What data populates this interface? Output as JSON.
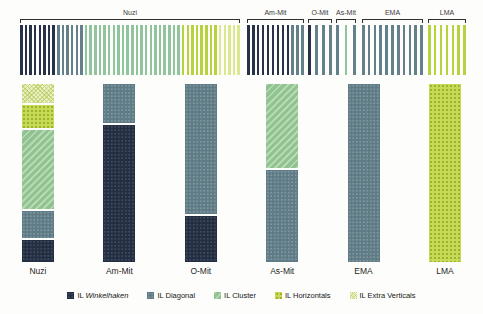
{
  "background": "#fdfdfb",
  "palette": {
    "winkelhaken": "#232e42",
    "diagonal": "#5e7b86",
    "cluster": "#8fc394",
    "horizontals": "#c0d545",
    "extra_verticals": "#dde9a4"
  },
  "top_strip": {
    "groups": [
      {
        "label": "Nuzi",
        "left": 20,
        "width": 220,
        "segments": [
          {
            "category": "winkelhaken",
            "count": 8
          },
          {
            "category": "diagonal",
            "count": 6
          },
          {
            "category": "cluster",
            "count": 21
          },
          {
            "category": "horizontals",
            "count": 8
          },
          {
            "category": "extra_verticals",
            "count": 5
          }
        ]
      },
      {
        "label": "Am-Mit",
        "left": 247,
        "width": 57,
        "segments": [
          {
            "category": "winkelhaken",
            "count": 9
          },
          {
            "category": "diagonal",
            "count": 3
          }
        ]
      },
      {
        "label": "O-Mit",
        "left": 308,
        "width": 24,
        "segments": [
          {
            "category": "winkelhaken",
            "count": 1
          },
          {
            "category": "diagonal",
            "count": 3
          }
        ]
      },
      {
        "label": "As-Mit",
        "left": 336,
        "width": 20,
        "segments": [
          {
            "category": "diagonal",
            "count": 1
          },
          {
            "category": "cluster",
            "count": 1
          },
          {
            "category": "diagonal",
            "count": 1
          }
        ]
      },
      {
        "label": "EMA",
        "left": 362,
        "width": 61,
        "segments": [
          {
            "category": "diagonal",
            "count": 11
          }
        ]
      },
      {
        "label": "LMA",
        "left": 428,
        "width": 38,
        "segments": [
          {
            "category": "horizontals",
            "count": 7
          }
        ]
      }
    ]
  },
  "chart_data": {
    "type": "bar",
    "stacked": true,
    "unit": "percent-of-column",
    "title": "",
    "xlabel": "",
    "ylabel": "",
    "ylim": [
      0,
      100
    ],
    "grid": false,
    "legend_position": "bottom",
    "categories": [
      "Nuzi",
      "Am-Mit",
      "O-Mit",
      "As-Mit",
      "EMA",
      "LMA"
    ],
    "stack_order_top_to_bottom": [
      "extra_verticals",
      "horizontals",
      "cluster",
      "diagonal",
      "winkelhaken"
    ],
    "series": [
      {
        "name": "IL Winkelhaken",
        "key": "winkelhaken",
        "values": [
          13,
          78,
          26,
          0,
          0,
          0
        ]
      },
      {
        "name": "IL Diagonal",
        "key": "diagonal",
        "values": [
          16,
          22,
          74,
          52,
          100,
          0
        ]
      },
      {
        "name": "IL Cluster",
        "key": "cluster",
        "values": [
          46,
          0,
          0,
          48,
          0,
          0
        ]
      },
      {
        "name": "IL Horizontals",
        "key": "horizontals",
        "values": [
          14,
          0,
          0,
          0,
          0,
          100
        ]
      },
      {
        "name": "IL Extra Verticals",
        "key": "extra_verticals",
        "values": [
          11,
          0,
          0,
          0,
          0,
          0
        ]
      }
    ]
  },
  "legend": {
    "items": [
      {
        "prefix": "IL",
        "name": "Winkelhaken",
        "italic": true,
        "key": "winkelhaken"
      },
      {
        "prefix": "IL",
        "name": "Diagonal",
        "italic": false,
        "key": "diagonal"
      },
      {
        "prefix": "IL",
        "name": "Cluster",
        "italic": false,
        "key": "cluster"
      },
      {
        "prefix": "IL",
        "name": "Horizontals",
        "italic": false,
        "key": "horizontals"
      },
      {
        "prefix": "IL",
        "name": "Extra Verticals",
        "italic": false,
        "key": "extra_verticals"
      }
    ]
  }
}
